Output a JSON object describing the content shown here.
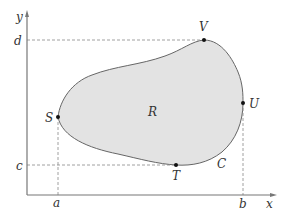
{
  "diagram": {
    "axes": {
      "x_label": "x",
      "y_label": "y",
      "color": "#777777"
    },
    "ticks": {
      "x": [
        {
          "label": "a",
          "x": 58
        },
        {
          "label": "b",
          "x": 243
        }
      ],
      "y": [
        {
          "label": "d",
          "y": 40
        },
        {
          "label": "c",
          "y": 165
        }
      ]
    },
    "region": {
      "label": "R",
      "fill": "#e3e3e3",
      "stroke": "#666666"
    },
    "curve": {
      "label": "C"
    },
    "points": [
      {
        "label": "V",
        "desc": "topmost point",
        "x": 204,
        "y": 40
      },
      {
        "label": "U",
        "desc": "rightmost point",
        "x": 243,
        "y": 103
      },
      {
        "label": "S",
        "desc": "leftmost point",
        "x": 58,
        "y": 117
      },
      {
        "label": "T",
        "desc": "bottommost point",
        "x": 176,
        "y": 165
      }
    ],
    "guide_line_color": "#888888",
    "point_color": "#111111"
  }
}
